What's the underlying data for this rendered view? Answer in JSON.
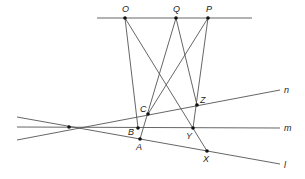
{
  "figure": {
    "type": "projective-geometry-diagram",
    "points": [
      {
        "id": "O",
        "label": "O"
      },
      {
        "id": "Q",
        "label": "Q"
      },
      {
        "id": "P",
        "label": "P"
      },
      {
        "id": "C",
        "label": "C"
      },
      {
        "id": "B",
        "label": "B"
      },
      {
        "id": "A",
        "label": "A"
      },
      {
        "id": "Z",
        "label": "Z"
      },
      {
        "id": "Y",
        "label": "Y"
      },
      {
        "id": "X",
        "label": "X"
      },
      {
        "id": "V",
        "label": ""
      }
    ],
    "lines": [
      {
        "id": "n",
        "label": "n"
      },
      {
        "id": "m",
        "label": "m"
      },
      {
        "id": "l",
        "label": "l"
      },
      {
        "id": "top",
        "label": ""
      }
    ],
    "segments": [
      [
        "O",
        "B"
      ],
      [
        "O",
        "X"
      ],
      [
        "Q",
        "A"
      ],
      [
        "Q",
        "Z"
      ],
      [
        "P",
        "C"
      ],
      [
        "P",
        "Y"
      ]
    ]
  }
}
